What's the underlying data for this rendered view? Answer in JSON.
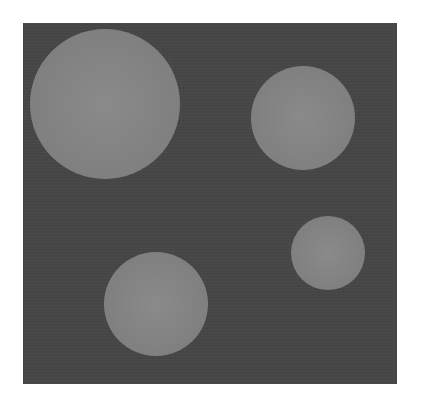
{
  "image": {
    "background_color": "#ffffff",
    "panel": {
      "x": 23,
      "y": 23,
      "width": 374,
      "height": 361,
      "color": "#464646"
    },
    "circles": [
      {
        "cx": 105,
        "cy": 104,
        "r": 75,
        "color": "#838383"
      },
      {
        "cx": 303,
        "cy": 118,
        "r": 52,
        "color": "#838383"
      },
      {
        "cx": 328,
        "cy": 253,
        "r": 37,
        "color": "#838383"
      },
      {
        "cx": 156,
        "cy": 304,
        "r": 52,
        "color": "#838383"
      }
    ]
  }
}
